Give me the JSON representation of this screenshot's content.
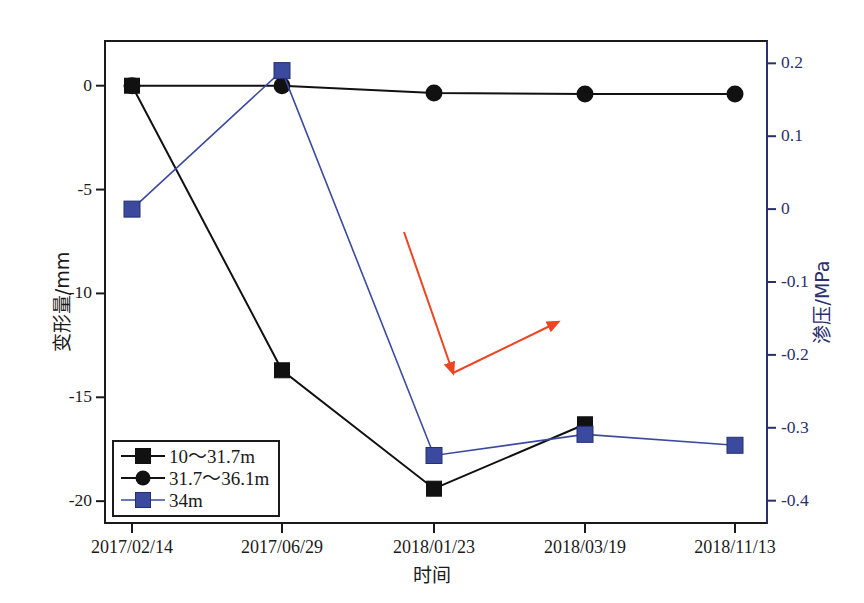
{
  "chart_data": {
    "type": "line",
    "title": "",
    "xlabel": "时间",
    "ylabel": "变形量/mm",
    "ylabel_right": "渗压/MPa",
    "categories": [
      "2017/02/14",
      "2017/06/29",
      "2018/01/23",
      "2018/03/19",
      "2018/11/13"
    ],
    "ylim": [
      -21.1,
      2.2
    ],
    "yticks": [
      "0",
      "-5",
      "-10",
      "-15",
      "-20"
    ],
    "ytick_values": [
      0,
      -5,
      -10,
      -15,
      -20
    ],
    "ylim_right": [
      -0.432,
      0.232
    ],
    "yticks_right": [
      "0.2",
      "0.1",
      "0",
      "-0.1",
      "-0.2",
      "-0.3",
      "-0.4"
    ],
    "ytick_values_right": [
      0.2,
      0.1,
      0,
      -0.1,
      -0.2,
      -0.3,
      -0.4
    ],
    "grid": false,
    "legend_position": "lower-left",
    "series": [
      {
        "name": "10～31.7m",
        "axis": "left",
        "marker": "square",
        "color": "#111111",
        "values": [
          0.0,
          -13.7,
          -19.4,
          -16.3,
          null
        ]
      },
      {
        "name": "31.7～36.1m",
        "axis": "left",
        "marker": "circle",
        "color": "#111111",
        "values": [
          0.0,
          0.0,
          -0.35,
          -0.4,
          -0.4
        ]
      },
      {
        "name": "34m",
        "axis": "right",
        "marker": "square",
        "color": "#3b4a9e",
        "values": [
          0.0,
          0.19,
          -0.338,
          -0.309,
          -0.324
        ]
      }
    ],
    "annotations": [
      {
        "name": "red-arrow-down",
        "color": "#ee4422",
        "from_x": 404,
        "from_y": 232,
        "to_x": 453,
        "to_y": 373
      },
      {
        "name": "red-arrow-up-right",
        "color": "#ee4422",
        "from_x": 453,
        "from_y": 373,
        "to_x": 558,
        "to_y": 322
      }
    ]
  },
  "axes": {
    "left": {
      "label": "变形量/mm",
      "ticks": [
        "0",
        "-5",
        "-10",
        "-15",
        "-20"
      ]
    },
    "right": {
      "label": "渗压/MPa",
      "ticks": [
        "0.2",
        "0.1",
        "0",
        "-0.1",
        "-0.2",
        "-0.3",
        "-0.4"
      ]
    },
    "x": {
      "label": "时间",
      "ticks": [
        "2017/02/14",
        "2017/06/29",
        "2018/01/23",
        "2018/03/19",
        "2018/11/13"
      ]
    }
  },
  "legend": {
    "items": [
      {
        "label": "10～31.7m",
        "marker": "square",
        "color": "#111111"
      },
      {
        "label": "31.7～36.1m",
        "marker": "circle",
        "color": "#111111"
      },
      {
        "label": "34m",
        "marker": "square",
        "color": "#3b4a9e"
      }
    ]
  },
  "colors": {
    "axis_left": "#1a1a1a",
    "axis_right": "#2b2f6b",
    "series_black": "#111111",
    "series_blue": "#3b4a9e",
    "annotation_red": "#ee4422"
  }
}
